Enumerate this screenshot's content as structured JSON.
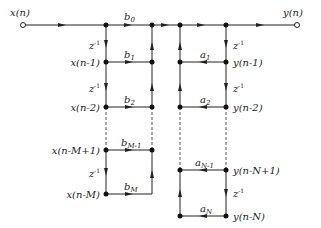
{
  "diagram": {
    "input_label": "x(n)",
    "output_label": "y(n)",
    "delay_label": "z",
    "delay_exp": "-1",
    "feedforward": {
      "taps": [
        {
          "node": "x(n-1)",
          "coef": "b",
          "sub": "1"
        },
        {
          "node": "x(n-2)",
          "coef": "b",
          "sub": "2"
        },
        {
          "node": "x(n-M+1)",
          "coef": "b",
          "sub": "M-1"
        },
        {
          "node": "x(n-M)",
          "coef": "b",
          "sub": "M"
        }
      ],
      "b0": {
        "coef": "b",
        "sub": "0"
      }
    },
    "feedback": {
      "taps": [
        {
          "node": "y(n-1)",
          "coef": "a",
          "sub": "1"
        },
        {
          "node": "y(n-2)",
          "coef": "a",
          "sub": "2"
        },
        {
          "node": "y(n-N+1)",
          "coef": "a",
          "sub": "N-1"
        },
        {
          "node": "y(n-N)",
          "coef": "a",
          "sub": "N"
        }
      ]
    }
  }
}
